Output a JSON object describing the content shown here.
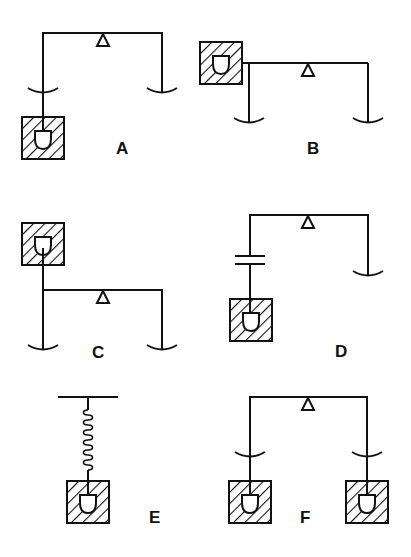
{
  "figure": {
    "panels": [
      {
        "id": "A",
        "label": "A",
        "content": "Balance beam with fulcrum; hatched box with cup hangs below left pan"
      },
      {
        "id": "B",
        "label": "B",
        "content": "Hatched box with cup attached at left end of beam above left pan"
      },
      {
        "id": "C",
        "label": "C",
        "content": "Hatched box with cup mounted above left end of beam"
      },
      {
        "id": "D",
        "label": "D",
        "content": "Left arm interrupted by a gap (parallel plates) with hatched box hanging below; right pan only"
      },
      {
        "id": "E",
        "label": "E",
        "content": "Hatched box with cup suspended from a bar by a coil spring"
      },
      {
        "id": "F",
        "label": "F",
        "content": "Balance beam with hatched boxes with cups hanging below both pans"
      }
    ]
  },
  "colors": {
    "stroke": "#111111",
    "background": "#ffffff"
  }
}
